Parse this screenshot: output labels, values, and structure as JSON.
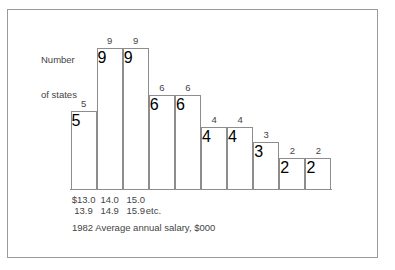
{
  "figure": {
    "caption": "1982 Average annual salary, $000",
    "y_axis_title_line1": "Number",
    "y_axis_title_line2": "of states",
    "etc_label": "etc.",
    "frame_color": "#9a9a9a",
    "line_color": "#8d8d8d",
    "text_color": "#444444",
    "background_color": "#ffffff"
  },
  "chart_data": {
    "type": "bar",
    "title": "",
    "subtitle": "",
    "xlabel": "1982 Average annual salary, $000",
    "ylabel": "Number of states",
    "grid": false,
    "legend": false,
    "ylim": [
      0,
      10
    ],
    "bar_style": "histogram-contiguous",
    "categories": [
      "$13.0-13.9",
      "14.0-14.9",
      "15.0-15.9",
      "16.0-16.9",
      "17.0-17.9",
      "18.0-18.9",
      "19.0-19.9",
      "20.0-20.9",
      "21.0-21.9",
      "22.0-22.9"
    ],
    "values": [
      5,
      9,
      9,
      6,
      6,
      4,
      4,
      3,
      2,
      2
    ],
    "data_labels": [
      "5",
      "9",
      "9",
      "6",
      "6",
      "4",
      "4",
      "3",
      "2",
      "2"
    ],
    "tick_labels": [
      {
        "line1": "$13.0",
        "line2": "13.9"
      },
      {
        "line1": "14.0",
        "line2": "14.9"
      },
      {
        "line1": "15.0",
        "line2": "15.9"
      }
    ],
    "tick_suffix": "etc."
  }
}
